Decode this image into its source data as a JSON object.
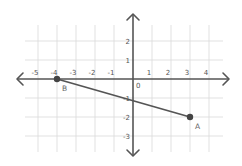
{
  "chart_data": {
    "type": "scatter",
    "title": "",
    "xlabel": "",
    "ylabel": "",
    "xlim": [
      -5.7,
      4.7
    ],
    "ylim": [
      -3.8,
      2.8
    ],
    "grid": true,
    "x_ticks": [
      {
        "value": -5,
        "label": "-5"
      },
      {
        "value": -4,
        "label": "-4"
      },
      {
        "value": -3,
        "label": "-3"
      },
      {
        "value": -2,
        "label": "-2"
      },
      {
        "value": -1,
        "label": "-1"
      },
      {
        "value": 1,
        "label": "1"
      },
      {
        "value": 2,
        "label": "2"
      },
      {
        "value": 3,
        "label": "3"
      },
      {
        "value": 4,
        "label": "4"
      }
    ],
    "y_ticks": [
      {
        "value": 2,
        "label": "2"
      },
      {
        "value": 1,
        "label": "1"
      },
      {
        "value": -1,
        "label": "-1"
      },
      {
        "value": -2,
        "label": "-2"
      },
      {
        "value": -3,
        "label": "-3"
      }
    ],
    "origin_label": "0",
    "points": [
      {
        "name": "A",
        "x": 3,
        "y": -2
      },
      {
        "name": "B",
        "x": -4,
        "y": 0
      }
    ],
    "segments": [
      {
        "from": "B",
        "to": "A"
      }
    ],
    "colors": {
      "axis": "#555555",
      "grid": "#d9d9d9",
      "point": "#444444"
    }
  }
}
